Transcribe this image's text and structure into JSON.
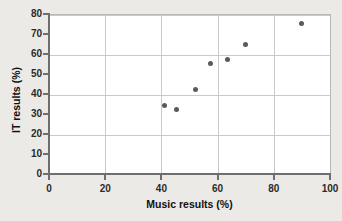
{
  "chart_data": {
    "type": "scatter",
    "title": "",
    "xlabel": "Music results (%)",
    "ylabel": "IT results (%)",
    "xlim": [
      0,
      100
    ],
    "ylim": [
      0,
      80
    ],
    "xticks": [
      "0",
      "20",
      "40",
      "60",
      "80",
      "100"
    ],
    "xtick_values": [
      0,
      20,
      40,
      60,
      80,
      100
    ],
    "yticks": [
      "0",
      "10",
      "20",
      "30",
      "40",
      "50",
      "60",
      "70",
      "80"
    ],
    "ytick_values": [
      0,
      10,
      20,
      30,
      40,
      50,
      60,
      70,
      80
    ],
    "grid": true,
    "grid_x_values": [
      20,
      40,
      60,
      80
    ],
    "grid_y_values": [
      20,
      40,
      60,
      80
    ],
    "legend": null,
    "marker_color": "#5a5a5a",
    "points": [
      {
        "x": 41,
        "y": 34.5
      },
      {
        "x": 45.5,
        "y": 32.5
      },
      {
        "x": 52,
        "y": 42.5
      },
      {
        "x": 57.5,
        "y": 55.5
      },
      {
        "x": 63.5,
        "y": 57.5
      },
      {
        "x": 70,
        "y": 65
      },
      {
        "x": 90,
        "y": 75.5
      }
    ]
  },
  "colors": {
    "background": "#eceae6",
    "plot_background": "#ffffff",
    "axis": "#6e6e6e",
    "grid": "#c9c9c9",
    "marker": "#5a5a5a",
    "text": "#111111"
  }
}
